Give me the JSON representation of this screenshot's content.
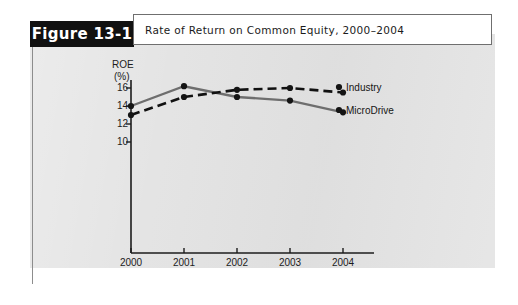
{
  "figure": {
    "tab_label": "Figure 13-1",
    "title": "Rate of Return on Common Equity, 2000–2004"
  },
  "colors": {
    "panel_background": "#e3e3e3",
    "tab_background": "#111111",
    "tab_text": "#ffffff",
    "title_background": "#ffffff",
    "axis": "#1c1c1c",
    "industry_series": "#111111",
    "microdrive_series": "#6e6e6e"
  },
  "chart_data": {
    "type": "line",
    "title": "Rate of Return on Common Equity, 2000–2004",
    "xlabel": "",
    "ylabel": "ROE (%)",
    "ylabel_line1": "ROE",
    "ylabel_line2": "(%)",
    "categories": [
      "2000",
      "2001",
      "2002",
      "2003",
      "2004"
    ],
    "x": [
      2000,
      2001,
      2002,
      2003,
      2004
    ],
    "yticks": [
      10,
      12,
      14,
      16
    ],
    "ytick_labels": [
      "10",
      "12",
      "14",
      "16"
    ],
    "ylim": [
      8.5,
      17.2
    ],
    "grid": false,
    "legend_position": "right",
    "series": [
      {
        "name": "Industry",
        "style": "dashed",
        "color": "#111111",
        "values": [
          13.0,
          15.0,
          15.8,
          16.0,
          15.5
        ]
      },
      {
        "name": "MicroDrive",
        "style": "solid",
        "color": "#6e6e6e",
        "values": [
          14.0,
          16.2,
          15.0,
          14.6,
          13.3
        ]
      }
    ]
  }
}
